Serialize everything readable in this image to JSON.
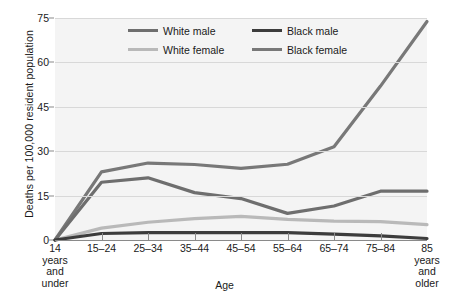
{
  "chart_data": {
    "type": "line",
    "title": "",
    "xlabel": "Age",
    "ylabel": "Deaths per 100,000 resident population",
    "categories": [
      "14 years and under",
      "15–24",
      "25–34",
      "35–44",
      "45–54",
      "55–64",
      "65–74",
      "75–84",
      "85 years and older"
    ],
    "category_lines": [
      [
        "14",
        "years",
        "and",
        "under"
      ],
      [
        "15–24"
      ],
      [
        "25–34"
      ],
      [
        "35–44"
      ],
      [
        "45–54"
      ],
      [
        "55–64"
      ],
      [
        "65–74"
      ],
      [
        "75–84"
      ],
      [
        "85",
        "years",
        "and",
        "older"
      ]
    ],
    "ylim": [
      0,
      75
    ],
    "yticks": [
      0,
      15,
      30,
      45,
      60,
      75
    ],
    "ytick_labels": [
      "0",
      "15",
      "30",
      "45",
      "60",
      "75"
    ],
    "grid": true,
    "legend_position": "top-center",
    "series": [
      {
        "name": "White male",
        "color": "#6e6e6e",
        "values": [
          0,
          19.5,
          21,
          16,
          14,
          9,
          11.5,
          16.5,
          16.5
        ]
      },
      {
        "name": "Black male",
        "color": "#3c3c3c",
        "values": [
          0,
          2.2,
          2.5,
          2.5,
          2.5,
          2.5,
          2.0,
          1.4,
          0.5
        ]
      },
      {
        "name": "White female",
        "color": "#b9b9b9",
        "values": [
          0,
          4.0,
          6.0,
          7.2,
          8.0,
          7.0,
          6.4,
          6.2,
          5.2
        ]
      },
      {
        "name": "Black female",
        "color": "#787878",
        "values": [
          0,
          23,
          26,
          25.5,
          24.2,
          25.6,
          31.5,
          52,
          73.8
        ]
      }
    ]
  },
  "legend": {
    "items": [
      {
        "label": "White male",
        "color": "#6e6e6e"
      },
      {
        "label": "Black male",
        "color": "#3c3c3c"
      },
      {
        "label": "White female",
        "color": "#b9b9b9"
      },
      {
        "label": "Black female",
        "color": "#787878"
      }
    ]
  },
  "colors": {
    "plot_background": "#f4f4f4",
    "figure_background": "#ffffff",
    "gridline": "#d8d8d8",
    "axis": "#8a8a8a",
    "text": "#1a1a1a"
  }
}
